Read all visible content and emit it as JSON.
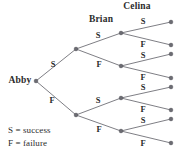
{
  "diagram": {
    "root": {
      "label": "Abby",
      "x": 36,
      "y": 81,
      "label_x": 20,
      "label_y": 81
    },
    "column_headers": [
      {
        "name": "header-brian",
        "label": "Brian",
        "x": 101,
        "y": 20
      },
      {
        "name": "header-celina",
        "label": "Celina",
        "x": 137,
        "y": 7
      }
    ],
    "nodes": [
      {
        "id": "n-root",
        "x": 36,
        "y": 81,
        "depth": 0
      },
      {
        "id": "n-s",
        "x": 76,
        "y": 49,
        "depth": 1
      },
      {
        "id": "n-f",
        "x": 76,
        "y": 115,
        "depth": 1
      },
      {
        "id": "n-ss",
        "x": 121,
        "y": 33,
        "depth": 2
      },
      {
        "id": "n-sf",
        "x": 121,
        "y": 66,
        "depth": 2
      },
      {
        "id": "n-fs",
        "x": 121,
        "y": 98,
        "depth": 2
      },
      {
        "id": "n-ff",
        "x": 121,
        "y": 131,
        "depth": 2
      },
      {
        "id": "n-sss",
        "x": 171,
        "y": 22,
        "depth": 3
      },
      {
        "id": "n-ssf",
        "x": 171,
        "y": 45,
        "depth": 3
      },
      {
        "id": "n-sfs",
        "x": 171,
        "y": 54,
        "depth": 3
      },
      {
        "id": "n-sff",
        "x": 171,
        "y": 78,
        "depth": 3
      },
      {
        "id": "n-fss",
        "x": 171,
        "y": 87,
        "depth": 3
      },
      {
        "id": "n-fsf",
        "x": 171,
        "y": 110,
        "depth": 3
      },
      {
        "id": "n-ffs",
        "x": 171,
        "y": 119,
        "depth": 3
      },
      {
        "id": "n-fff",
        "x": 171,
        "y": 143,
        "depth": 3
      }
    ],
    "edges": [
      {
        "id": "e-root-s",
        "from": "n-root",
        "to": "n-s",
        "label": "S",
        "label_x": 53,
        "label_y": 64
      },
      {
        "id": "e-root-f",
        "from": "n-root",
        "to": "n-f",
        "label": "F",
        "label_x": 52,
        "label_y": 100
      },
      {
        "id": "e-s-ss",
        "from": "n-s",
        "to": "n-ss",
        "label": "S",
        "label_x": 98,
        "label_y": 35
      },
      {
        "id": "e-s-sf",
        "from": "n-s",
        "to": "n-sf",
        "label": "F",
        "label_x": 99,
        "label_y": 64
      },
      {
        "id": "e-f-fs",
        "from": "n-f",
        "to": "n-fs",
        "label": "S",
        "label_x": 98,
        "label_y": 100
      },
      {
        "id": "e-f-ff",
        "from": "n-f",
        "to": "n-ff",
        "label": "F",
        "label_x": 99,
        "label_y": 129
      },
      {
        "id": "e-ss-sss",
        "from": "n-ss",
        "to": "n-sss",
        "label": "S",
        "label_x": 143,
        "label_y": 21
      },
      {
        "id": "e-ss-ssf",
        "from": "n-ss",
        "to": "n-ssf",
        "label": "F",
        "label_x": 143,
        "label_y": 44
      },
      {
        "id": "e-sf-sfs",
        "from": "n-sf",
        "to": "n-sfs",
        "label": "S",
        "label_x": 143,
        "label_y": 55
      },
      {
        "id": "e-sf-sff",
        "from": "n-sf",
        "to": "n-sff",
        "label": "F",
        "label_x": 143,
        "label_y": 77
      },
      {
        "id": "e-fs-fss",
        "from": "n-fs",
        "to": "n-fss",
        "label": "S",
        "label_x": 143,
        "label_y": 87
      },
      {
        "id": "e-fs-fsf",
        "from": "n-fs",
        "to": "n-fsf",
        "label": "F",
        "label_x": 143,
        "label_y": 109
      },
      {
        "id": "e-ff-ffs",
        "from": "n-ff",
        "to": "n-ffs",
        "label": "S",
        "label_x": 143,
        "label_y": 120
      },
      {
        "id": "e-ff-fff",
        "from": "n-ff",
        "to": "n-fff",
        "label": "F",
        "label_x": 143,
        "label_y": 143
      }
    ],
    "legend": {
      "x": 8,
      "y": 126,
      "entries": [
        {
          "name": "legend-success",
          "text": "S = success"
        },
        {
          "name": "legend-failure",
          "text": "F = failure"
        }
      ]
    },
    "colors": {
      "background": "#ffffff",
      "line": "#6f6f76",
      "node": "#6b6b72",
      "text": "#2b2b2b"
    }
  }
}
